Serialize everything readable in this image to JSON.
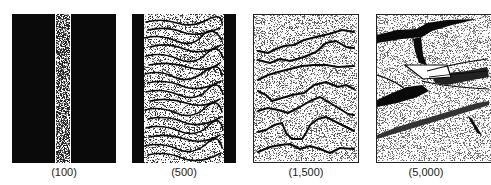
{
  "figure": {
    "panels": [
      {
        "id": "p100",
        "label": "(100)",
        "magnification": "100"
      },
      {
        "id": "p500",
        "label": "(500)",
        "magnification": "500"
      },
      {
        "id": "p1500",
        "label": "(1,500)",
        "magnification": "1,500"
      },
      {
        "id": "p5000",
        "label": "(5,000)",
        "magnification": "5,000"
      }
    ],
    "colors": {
      "ink": "#0a0a0a",
      "paper": "#ffffff"
    }
  }
}
